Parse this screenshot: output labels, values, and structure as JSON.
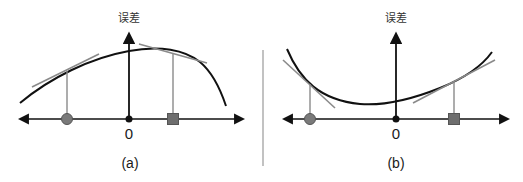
{
  "panels": [
    {
      "id": "a",
      "caption": "(a)",
      "y_axis_label": "误差",
      "origin_label": "0",
      "curve": "concave (downward-opening)",
      "markers": [
        {
          "shape": "circle",
          "side": "left",
          "tangent": "positive slope"
        },
        {
          "shape": "square",
          "side": "right",
          "tangent": "negative slope"
        }
      ]
    },
    {
      "id": "b",
      "caption": "(b)",
      "y_axis_label": "误差",
      "origin_label": "0",
      "curve": "convex (upward-opening)",
      "markers": [
        {
          "shape": "circle",
          "side": "left",
          "tangent": "negative slope"
        },
        {
          "shape": "square",
          "side": "right",
          "tangent": "positive slope"
        }
      ]
    }
  ],
  "colors": {
    "axis": "#111111",
    "curve": "#111111",
    "tangent": "#8a8a8a",
    "drop_line": "#8a8a8a",
    "marker_fill": "#7a7a7a",
    "marker_stroke": "#555555",
    "divider": "#999999"
  }
}
